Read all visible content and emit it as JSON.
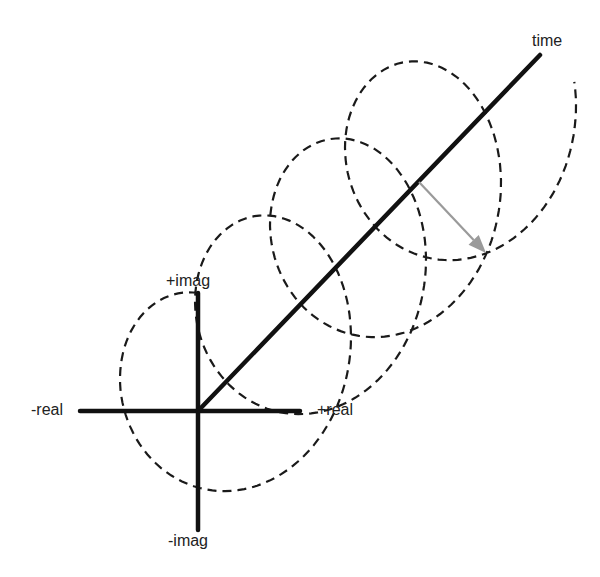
{
  "diagram": {
    "labels": {
      "plus_imag": "+imag",
      "minus_imag": "-imag",
      "plus_real": "+real",
      "minus_real": "-real",
      "time": "time"
    },
    "colors": {
      "axis": "#111111",
      "helix": "#1a1a1a",
      "arrow": "#9a9a9a",
      "background": "#ffffff"
    },
    "geometry": {
      "origin": [
        198,
        411
      ],
      "real_axis": [
        [
          80,
          411
        ],
        [
          300,
          411
        ]
      ],
      "imag_axis": [
        [
          198,
          293
        ],
        [
          198,
          530
        ]
      ],
      "time_axis": [
        [
          198,
          411
        ],
        [
          540,
          55
        ]
      ],
      "helix": {
        "turns": 3.8,
        "step_per_turn": [
          75,
          -77
        ],
        "rx": 96,
        "ry": 118,
        "start_angle_deg": 90,
        "direction": "counterclockwise",
        "dash": "9 6"
      },
      "arrow": {
        "from": [
          419,
          182
        ],
        "to": [
          486,
          253
        ]
      }
    }
  }
}
